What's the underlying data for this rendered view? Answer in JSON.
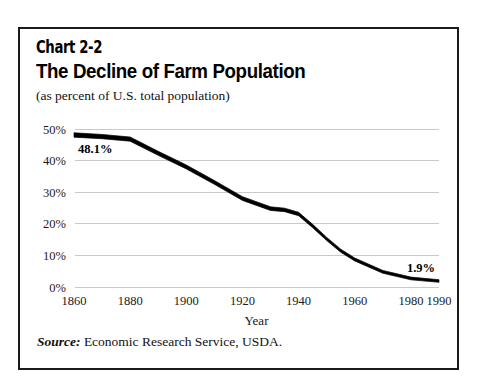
{
  "card": {
    "chart_number": "Chart 2-2",
    "title": "The Decline of Farm Population",
    "subtitle": "(as percent of U.S. total population)",
    "source_label": "Source:",
    "source_text": " Economic Research Service, USDA."
  },
  "chart_data": {
    "type": "line",
    "title": "The Decline of Farm Population",
    "subtitle": "(as percent of U.S. total population)",
    "xlabel": "Year",
    "ylabel": "",
    "xlim": [
      1860,
      1990
    ],
    "ylim": [
      0,
      50
    ],
    "grid": true,
    "legend": false,
    "line_color": "#000000",
    "x_ticks": [
      1860,
      1880,
      1900,
      1920,
      1940,
      1960,
      1980,
      1990
    ],
    "x_tick_labels": [
      "1860",
      "1880",
      "1900",
      "1920",
      "1940",
      "1960",
      "1980",
      "1990"
    ],
    "y_ticks": [
      0,
      10,
      20,
      30,
      40,
      50
    ],
    "y_tick_labels": [
      "0%",
      "10%",
      "20%",
      "30%",
      "40%",
      "50%"
    ],
    "x": [
      1860,
      1870,
      1880,
      1890,
      1900,
      1910,
      1920,
      1930,
      1935,
      1940,
      1945,
      1950,
      1955,
      1960,
      1970,
      1980,
      1990
    ],
    "values": [
      48.1,
      47.6,
      46.8,
      42.3,
      38.0,
      33.1,
      28.0,
      24.8,
      24.4,
      23.1,
      19.3,
      15.2,
      11.5,
      8.7,
      4.8,
      2.7,
      1.9
    ],
    "annotations": [
      {
        "label": "48.1%",
        "x": 1860,
        "y": 48.1,
        "position": "below-right"
      },
      {
        "label": "1.9%",
        "x": 1990,
        "y": 1.9,
        "position": "above-left"
      }
    ]
  }
}
